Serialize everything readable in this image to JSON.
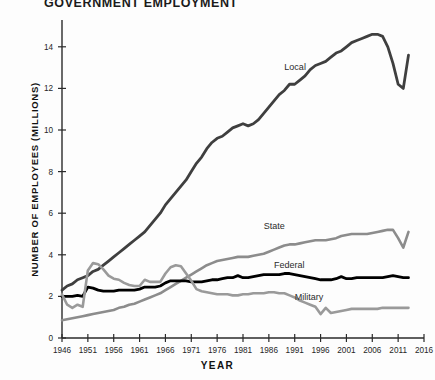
{
  "chart_data": {
    "type": "line",
    "title": "GOVERNMENT EMPLOYMENT",
    "xlabel": "YEAR",
    "ylabel": "NUMBER OF EMPLOYEES (MILLIONS)",
    "xlim": [
      1946,
      2016
    ],
    "ylim": [
      0,
      15
    ],
    "xticks": [
      1946,
      1951,
      1956,
      1961,
      1966,
      1971,
      1976,
      1981,
      1986,
      1991,
      1996,
      2001,
      2006,
      2011,
      2016
    ],
    "yticks": [
      0,
      2,
      4,
      6,
      8,
      10,
      12,
      14
    ],
    "grid": false,
    "legend_position": "inline-labels",
    "series": [
      {
        "name": "Local",
        "color": "#3f3f3f",
        "width": 2.8,
        "label_x": 1989,
        "label_y": 12.9,
        "x": [
          1946,
          1947,
          1948,
          1949,
          1950,
          1951,
          1952,
          1953,
          1954,
          1955,
          1956,
          1957,
          1958,
          1959,
          1960,
          1961,
          1962,
          1963,
          1964,
          1965,
          1966,
          1967,
          1968,
          1969,
          1970,
          1971,
          1972,
          1973,
          1974,
          1975,
          1976,
          1977,
          1978,
          1979,
          1980,
          1981,
          1982,
          1983,
          1984,
          1985,
          1986,
          1987,
          1988,
          1989,
          1990,
          1991,
          1992,
          1993,
          1994,
          1995,
          1996,
          1997,
          1998,
          1999,
          2000,
          2001,
          2002,
          2003,
          2004,
          2005,
          2006,
          2007,
          2008,
          2009,
          2010,
          2011,
          2012,
          2013
        ],
        "values": [
          2.3,
          2.5,
          2.6,
          2.8,
          2.9,
          3.0,
          3.2,
          3.3,
          3.5,
          3.7,
          3.9,
          4.1,
          4.3,
          4.5,
          4.7,
          4.9,
          5.1,
          5.4,
          5.7,
          6.0,
          6.4,
          6.7,
          7.0,
          7.3,
          7.6,
          8.0,
          8.4,
          8.7,
          9.1,
          9.4,
          9.6,
          9.7,
          9.9,
          10.1,
          10.2,
          10.3,
          10.2,
          10.3,
          10.5,
          10.8,
          11.1,
          11.4,
          11.7,
          11.9,
          12.2,
          12.2,
          12.4,
          12.6,
          12.9,
          13.1,
          13.2,
          13.3,
          13.5,
          13.7,
          13.8,
          14.0,
          14.2,
          14.3,
          14.4,
          14.5,
          14.6,
          14.6,
          14.5,
          14.0,
          13.2,
          12.2,
          12.0,
          13.6
        ]
      },
      {
        "name": "State",
        "color": "#8c8c8c",
        "width": 2.6,
        "label_x": 1985,
        "label_y": 5.25,
        "x": [
          1946,
          1947,
          1948,
          1949,
          1950,
          1951,
          1952,
          1953,
          1954,
          1955,
          1956,
          1957,
          1958,
          1959,
          1960,
          1961,
          1962,
          1963,
          1964,
          1965,
          1966,
          1967,
          1968,
          1969,
          1970,
          1971,
          1972,
          1973,
          1974,
          1975,
          1976,
          1977,
          1978,
          1979,
          1980,
          1981,
          1982,
          1983,
          1984,
          1985,
          1986,
          1987,
          1988,
          1989,
          1990,
          1991,
          1992,
          1993,
          1994,
          1995,
          1996,
          1997,
          1998,
          1999,
          2000,
          2001,
          2002,
          2003,
          2004,
          2005,
          2006,
          2007,
          2008,
          2009,
          2010,
          2011,
          2012,
          2013
        ],
        "values": [
          0.85,
          0.9,
          0.95,
          1.0,
          1.05,
          1.1,
          1.15,
          1.2,
          1.25,
          1.3,
          1.35,
          1.45,
          1.5,
          1.6,
          1.65,
          1.75,
          1.85,
          1.95,
          2.05,
          2.15,
          2.3,
          2.45,
          2.6,
          2.75,
          2.9,
          3.05,
          3.2,
          3.35,
          3.5,
          3.6,
          3.7,
          3.75,
          3.8,
          3.85,
          3.9,
          3.9,
          3.9,
          3.95,
          4.0,
          4.05,
          4.15,
          4.25,
          4.35,
          4.45,
          4.5,
          4.5,
          4.55,
          4.6,
          4.65,
          4.7,
          4.7,
          4.7,
          4.75,
          4.8,
          4.9,
          4.95,
          5.0,
          5.0,
          5.0,
          5.0,
          5.05,
          5.1,
          5.15,
          5.2,
          5.2,
          4.8,
          4.35,
          5.1
        ]
      },
      {
        "name": "Federal",
        "color": "#000000",
        "width": 2.8,
        "label_x": 1987,
        "label_y": 3.35,
        "x": [
          1946,
          1947,
          1948,
          1949,
          1950,
          1951,
          1952,
          1953,
          1954,
          1955,
          1956,
          1957,
          1958,
          1959,
          1960,
          1961,
          1962,
          1963,
          1964,
          1965,
          1966,
          1967,
          1968,
          1969,
          1970,
          1971,
          1972,
          1973,
          1974,
          1975,
          1976,
          1977,
          1978,
          1979,
          1980,
          1981,
          1982,
          1983,
          1984,
          1985,
          1986,
          1987,
          1988,
          1989,
          1990,
          1991,
          1992,
          1993,
          1994,
          1995,
          1996,
          1997,
          1998,
          1999,
          2000,
          2001,
          2002,
          2003,
          2004,
          2005,
          2006,
          2007,
          2008,
          2009,
          2010,
          2011,
          2012,
          2013
        ],
        "values": [
          2.0,
          2.0,
          2.0,
          2.05,
          2.0,
          2.45,
          2.4,
          2.3,
          2.25,
          2.25,
          2.25,
          2.3,
          2.3,
          2.3,
          2.3,
          2.35,
          2.45,
          2.45,
          2.45,
          2.5,
          2.65,
          2.75,
          2.75,
          2.75,
          2.75,
          2.7,
          2.7,
          2.7,
          2.75,
          2.8,
          2.8,
          2.85,
          2.9,
          2.9,
          3.0,
          2.9,
          2.9,
          2.95,
          3.0,
          3.05,
          3.05,
          3.05,
          3.05,
          3.1,
          3.1,
          3.05,
          3.0,
          2.95,
          2.9,
          2.85,
          2.8,
          2.8,
          2.8,
          2.85,
          2.95,
          2.85,
          2.85,
          2.9,
          2.9,
          2.9,
          2.9,
          2.9,
          2.9,
          2.95,
          3.0,
          2.95,
          2.9,
          2.9
        ]
      },
      {
        "name": "Military",
        "color": "#9a9a9a",
        "width": 2.6,
        "label_x": 1991,
        "label_y": 1.85,
        "x": [
          1946,
          1947,
          1948,
          1949,
          1950,
          1951,
          1952,
          1953,
          1954,
          1955,
          1956,
          1957,
          1958,
          1959,
          1960,
          1961,
          1962,
          1963,
          1964,
          1965,
          1966,
          1967,
          1968,
          1969,
          1970,
          1971,
          1972,
          1973,
          1974,
          1975,
          1976,
          1977,
          1978,
          1979,
          1980,
          1981,
          1982,
          1983,
          1984,
          1985,
          1986,
          1987,
          1988,
          1989,
          1990,
          1991,
          1992,
          1993,
          1994,
          1995,
          1996,
          1997,
          1998,
          1999,
          2000,
          2001,
          2002,
          2003,
          2004,
          2005,
          2006,
          2007,
          2008,
          2009,
          2010,
          2011,
          2012,
          2013
        ],
        "values": [
          2.1,
          1.6,
          1.45,
          1.6,
          1.5,
          3.25,
          3.6,
          3.55,
          3.3,
          3.0,
          2.85,
          2.8,
          2.65,
          2.55,
          2.5,
          2.5,
          2.8,
          2.7,
          2.7,
          2.7,
          3.1,
          3.4,
          3.5,
          3.45,
          3.1,
          2.75,
          2.35,
          2.25,
          2.2,
          2.15,
          2.1,
          2.1,
          2.1,
          2.05,
          2.05,
          2.1,
          2.1,
          2.15,
          2.15,
          2.15,
          2.2,
          2.2,
          2.15,
          2.15,
          2.05,
          1.95,
          1.8,
          1.7,
          1.6,
          1.5,
          1.15,
          1.45,
          1.2,
          1.25,
          1.3,
          1.35,
          1.4,
          1.4,
          1.4,
          1.4,
          1.4,
          1.4,
          1.45,
          1.45,
          1.45,
          1.45,
          1.45,
          1.45
        ]
      }
    ]
  }
}
